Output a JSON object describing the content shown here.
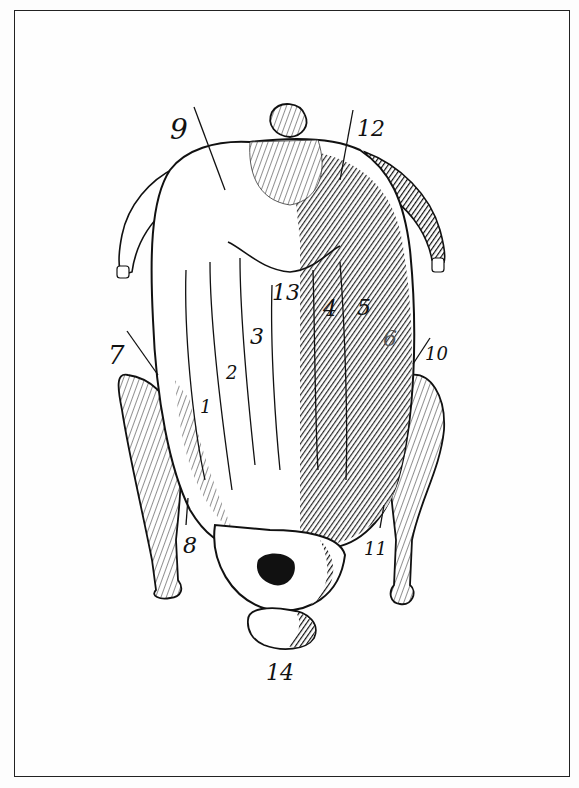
{
  "figure": {
    "style": "black ink engraving on white, framed",
    "colors": {
      "ink": "#111111",
      "paper": "#fdfdfd",
      "frame": "#222222"
    },
    "labels": [
      {
        "id": "1",
        "text": "1",
        "x": 200,
        "y": 398
      },
      {
        "id": "2",
        "text": "2",
        "x": 226,
        "y": 364
      },
      {
        "id": "3",
        "text": "3",
        "x": 250,
        "y": 326
      },
      {
        "id": "4",
        "text": "4",
        "x": 323,
        "y": 298
      },
      {
        "id": "5",
        "text": "5",
        "x": 357,
        "y": 297
      },
      {
        "id": "6",
        "text": "6",
        "x": 383,
        "y": 328
      },
      {
        "id": "7",
        "text": "7",
        "x": 110,
        "y": 344
      },
      {
        "id": "8",
        "text": "8",
        "x": 183,
        "y": 535
      },
      {
        "id": "9",
        "text": "9",
        "x": 172,
        "y": 118
      },
      {
        "id": "10",
        "text": "10",
        "x": 425,
        "y": 345
      },
      {
        "id": "11",
        "text": "11",
        "x": 364,
        "y": 540
      },
      {
        "id": "12",
        "text": "12",
        "x": 357,
        "y": 118
      },
      {
        "id": "13",
        "text": "13",
        "x": 273,
        "y": 282
      },
      {
        "id": "14",
        "text": "14",
        "x": 267,
        "y": 663
      }
    ]
  }
}
